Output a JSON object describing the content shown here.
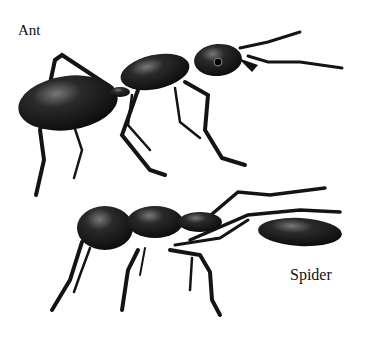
{
  "labels": {
    "ant": "Ant",
    "spider": "Spider"
  },
  "figures": [
    {
      "name": "ant",
      "description": "Black ant illustration, side view, facing right"
    },
    {
      "name": "spider",
      "description": "Ant-mimicking spider illustration, side view, facing left"
    }
  ],
  "colors": {
    "background": "#ffffff",
    "body": "#1a1a1a",
    "highlight": "#6a6a6a",
    "text": "#111111"
  }
}
